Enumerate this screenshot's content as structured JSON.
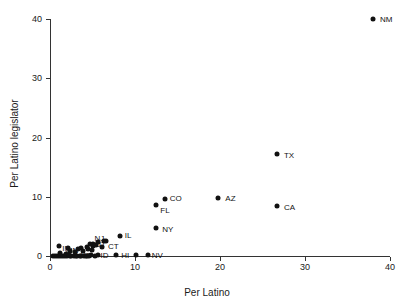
{
  "chart_data": {
    "type": "scatter",
    "title": "",
    "xlabel": "Per Latino",
    "ylabel": "Per Latino legislator",
    "xlim": [
      0,
      41.5
    ],
    "ylim": [
      0,
      41.5
    ],
    "xticks": [
      0,
      10,
      20,
      30,
      40
    ],
    "yticks": [
      0,
      10,
      20,
      30,
      40
    ],
    "xticklabels": [
      "0",
      "10",
      "20",
      "30",
      "40"
    ],
    "yticklabels": [
      "0",
      "10",
      "20",
      "30",
      "40"
    ],
    "grid": false,
    "legend": "none",
    "marker": "filled-circle",
    "marker_color": "#111111",
    "points": [
      {
        "label": "NM",
        "x": 38.0,
        "y": 40.0,
        "lx": 7,
        "ly": 0
      },
      {
        "label": "TX",
        "x": 26.7,
        "y": 17.2,
        "lx": 7,
        "ly": 1
      },
      {
        "label": "CA",
        "x": 26.7,
        "y": 8.4,
        "lx": 7,
        "ly": 1
      },
      {
        "label": "AZ",
        "x": 19.8,
        "y": 9.8,
        "lx": 7,
        "ly": 0
      },
      {
        "label": "CO",
        "x": 13.5,
        "y": 9.6,
        "lx": 5,
        "ly": -1
      },
      {
        "label": "FL",
        "x": 12.5,
        "y": 8.6,
        "lx": 4,
        "ly": 5
      },
      {
        "label": "NY",
        "x": 12.5,
        "y": 4.7,
        "lx": 6,
        "ly": 1
      },
      {
        "label": "IL",
        "x": 8.2,
        "y": 3.4,
        "lx": 5,
        "ly": -1
      },
      {
        "label": "CT",
        "x": 6.6,
        "y": 2.6,
        "lx": 2,
        "ly": 5
      },
      {
        "label": "NV",
        "x": 11.5,
        "y": 0.1,
        "lx": 4,
        "ly": 0
      },
      {
        "label": "",
        "x": 10.1,
        "y": 0.1,
        "lx": 0,
        "ly": 0
      },
      {
        "label": "HI",
        "x": 7.8,
        "y": 0.1,
        "lx": 5,
        "ly": 0
      },
      {
        "label": "ID",
        "x": 5.6,
        "y": 0.1,
        "lx": 3,
        "ly": 0
      },
      {
        "label": "KS",
        "x": 4.8,
        "y": 0.1,
        "lx": -10,
        "ly": 0
      },
      {
        "label": "UT",
        "x": 5.1,
        "y": 1.7,
        "lx": 2,
        "ly": -2
      },
      {
        "label": "NJ",
        "x": 5.0,
        "y": 2.1,
        "lx": 2,
        "ly": -6
      },
      {
        "label": "MN",
        "x": 2.1,
        "y": 1.3,
        "lx": -2,
        "ly": 2
      },
      {
        "label": "IN",
        "x": 1.1,
        "y": 1.7,
        "lx": 3,
        "ly": 2
      },
      {
        "label": "",
        "x": 0.4,
        "y": 0.05,
        "lx": 0,
        "ly": 0
      },
      {
        "label": "",
        "x": 0.6,
        "y": 0.05,
        "lx": 0,
        "ly": 0
      },
      {
        "label": "",
        "x": 0.8,
        "y": 0.05,
        "lx": 0,
        "ly": 0
      },
      {
        "label": "",
        "x": 1.0,
        "y": 0.05,
        "lx": 0,
        "ly": 0
      },
      {
        "label": "",
        "x": 1.3,
        "y": 0.05,
        "lx": 0,
        "ly": 0
      },
      {
        "label": "",
        "x": 1.5,
        "y": 0.05,
        "lx": 0,
        "ly": 0
      },
      {
        "label": "",
        "x": 1.8,
        "y": 0.05,
        "lx": 0,
        "ly": 0
      },
      {
        "label": "",
        "x": 2.0,
        "y": 0.05,
        "lx": 0,
        "ly": 0
      },
      {
        "label": "",
        "x": 2.3,
        "y": 0.05,
        "lx": 0,
        "ly": 0
      },
      {
        "label": "",
        "x": 2.5,
        "y": 0.05,
        "lx": 0,
        "ly": 0
      },
      {
        "label": "",
        "x": 2.8,
        "y": 0.05,
        "lx": 0,
        "ly": 0
      },
      {
        "label": "",
        "x": 3.0,
        "y": 0.05,
        "lx": 0,
        "ly": 0
      },
      {
        "label": "",
        "x": 3.2,
        "y": 0.05,
        "lx": 0,
        "ly": 0
      },
      {
        "label": "",
        "x": 3.5,
        "y": 0.05,
        "lx": 0,
        "ly": 0
      },
      {
        "label": "",
        "x": 3.7,
        "y": 0.05,
        "lx": 0,
        "ly": 0
      },
      {
        "label": "",
        "x": 4.0,
        "y": 0.05,
        "lx": 0,
        "ly": 0
      },
      {
        "label": "",
        "x": 4.2,
        "y": 0.05,
        "lx": 0,
        "ly": 0
      },
      {
        "label": "",
        "x": 4.4,
        "y": 0.05,
        "lx": 0,
        "ly": 0
      },
      {
        "label": "",
        "x": 4.6,
        "y": 0.05,
        "lx": 0,
        "ly": 0
      },
      {
        "label": "",
        "x": 5.3,
        "y": 0.05,
        "lx": 0,
        "ly": 0
      },
      {
        "label": "",
        "x": 1.2,
        "y": 0.5,
        "lx": 0,
        "ly": 0
      },
      {
        "label": "",
        "x": 1.9,
        "y": 0.4,
        "lx": 0,
        "ly": 0
      },
      {
        "label": "",
        "x": 2.4,
        "y": 0.9,
        "lx": 0,
        "ly": 0
      },
      {
        "label": "",
        "x": 2.9,
        "y": 0.6,
        "lx": 0,
        "ly": 0
      },
      {
        "label": "",
        "x": 3.3,
        "y": 1.1,
        "lx": 0,
        "ly": 0
      },
      {
        "label": "",
        "x": 3.6,
        "y": 1.4,
        "lx": 0,
        "ly": 0
      },
      {
        "label": "",
        "x": 3.9,
        "y": 0.8,
        "lx": 0,
        "ly": 0
      },
      {
        "label": "",
        "x": 4.3,
        "y": 1.6,
        "lx": 0,
        "ly": 0
      },
      {
        "label": "",
        "x": 4.5,
        "y": 1.2,
        "lx": 0,
        "ly": 0
      },
      {
        "label": "",
        "x": 4.7,
        "y": 2.0,
        "lx": 0,
        "ly": 0
      },
      {
        "label": "",
        "x": 5.4,
        "y": 1.9,
        "lx": 0,
        "ly": 0
      },
      {
        "label": "",
        "x": 5.7,
        "y": 2.3,
        "lx": 0,
        "ly": 0
      },
      {
        "label": "",
        "x": 6.1,
        "y": 1.5,
        "lx": 0,
        "ly": 0
      },
      {
        "label": "",
        "x": 6.4,
        "y": 2.5,
        "lx": 0,
        "ly": 0
      },
      {
        "label": "",
        "x": 2.2,
        "y": 0.2,
        "lx": 0,
        "ly": 0
      },
      {
        "label": "",
        "x": 4.9,
        "y": 1.0,
        "lx": 0,
        "ly": 0
      }
    ]
  }
}
